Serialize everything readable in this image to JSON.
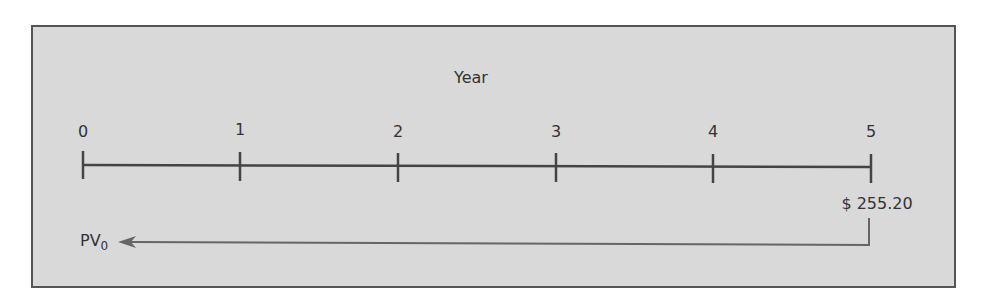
{
  "diagram": {
    "axis_title": "Year",
    "ticks": [
      {
        "label": "0",
        "x": 83
      },
      {
        "label": "1",
        "x": 240
      },
      {
        "label": "2",
        "x": 398
      },
      {
        "label": "3",
        "x": 556
      },
      {
        "label": "4",
        "x": 713
      },
      {
        "label": "5",
        "x": 871
      }
    ],
    "future_value": "$ 255.20",
    "present_value_label": "PV",
    "present_value_subscript": "0",
    "colors": {
      "panel": "#d9d9d9",
      "border": "#555555",
      "line": "#444444",
      "arrow": "#666666"
    }
  }
}
